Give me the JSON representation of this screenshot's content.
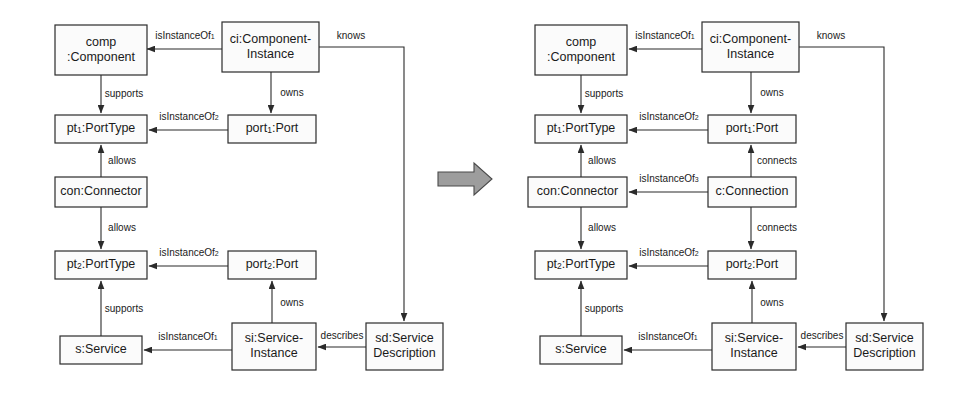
{
  "figure": {
    "background_color": "#ffffff",
    "box_fill": "#fbfbfb",
    "box_stroke": "#2b2b2b",
    "arrow_fill": "#9d9d9d",
    "arrow_stroke": "#4a4a4a"
  },
  "transform_arrow": {
    "name": "transformation-arrow",
    "direction": "right",
    "points": "438,172 474,172 474,163 492,179 474,195 474,186 438,186"
  },
  "diagrams": [
    {
      "id": "left",
      "name": "source-model-diagram",
      "nodes": [
        {
          "id": "comp",
          "name": "node-comp-component",
          "lines": [
            "comp",
            ":Component"
          ],
          "x": 55,
          "y": 25,
          "w": 92,
          "h": 50
        },
        {
          "id": "ci",
          "name": "node-ci-component-instance",
          "lines": [
            "ci:Component-",
            "Instance"
          ],
          "x": 222,
          "y": 22,
          "w": 97,
          "h": 50
        },
        {
          "id": "pt1",
          "name": "node-pt1-porttype",
          "lines": [
            "pt|1|:PortType"
          ],
          "x": 55,
          "y": 115,
          "w": 92,
          "h": 28
        },
        {
          "id": "port1",
          "name": "node-port1-port",
          "lines": [
            "port|1|:Port"
          ],
          "x": 228,
          "y": 115,
          "w": 88,
          "h": 28
        },
        {
          "id": "con",
          "name": "node-con-connector",
          "lines": [
            "con:Connector"
          ],
          "x": 55,
          "y": 177,
          "w": 92,
          "h": 30
        },
        {
          "id": "pt2",
          "name": "node-pt2-porttype",
          "lines": [
            "pt|2|:PortType"
          ],
          "x": 55,
          "y": 251,
          "w": 92,
          "h": 28
        },
        {
          "id": "port2",
          "name": "node-port2-port",
          "lines": [
            "port|2|:Port"
          ],
          "x": 228,
          "y": 251,
          "w": 88,
          "h": 28
        },
        {
          "id": "s",
          "name": "node-s-service",
          "lines": [
            "s:Service"
          ],
          "x": 60,
          "y": 336,
          "w": 82,
          "h": 28
        },
        {
          "id": "si",
          "name": "node-si-service-instance",
          "lines": [
            "si:Service-",
            "Instance"
          ],
          "x": 232,
          "y": 323,
          "w": 84,
          "h": 47
        },
        {
          "id": "sd",
          "name": "node-sd-service-description",
          "lines": [
            "sd:Service",
            "Description"
          ],
          "x": 366,
          "y": 323,
          "w": 77,
          "h": 47
        }
      ],
      "edges": [
        {
          "name": "edge-isinstanceof1-ci-comp",
          "label": "isInstanceOf|1|",
          "path": "222,49 147,49",
          "label_x": 185,
          "label_y": 36
        },
        {
          "name": "edge-knows-ci-sd",
          "label": "knows",
          "path": "319,47 404,47 404,321",
          "label_x": 351,
          "label_y": 36
        },
        {
          "name": "edge-supports-comp-pt1",
          "label": "supports",
          "path": "101,75 101,113",
          "label_x": 124,
          "label_y": 94
        },
        {
          "name": "edge-owns-ci-port1",
          "label": "owns",
          "path": "271,72 271,113",
          "label_x": 292,
          "label_y": 93
        },
        {
          "name": "edge-isinstanceof2-port1-pt1",
          "label": "isInstanceOf|2|",
          "path": "228,130 149,130",
          "label_x": 189,
          "label_y": 117
        },
        {
          "name": "edge-allows-con-pt1",
          "label": "allows",
          "path": "101,177 101,145",
          "label_x": 122,
          "label_y": 161
        },
        {
          "name": "edge-allows-con-pt2",
          "label": "allows",
          "path": "101,207 101,249",
          "label_x": 122,
          "label_y": 228
        },
        {
          "name": "edge-isinstanceof2-port2-pt2",
          "label": "isInstanceOf|2|",
          "path": "228,266 149,266",
          "label_x": 189,
          "label_y": 253
        },
        {
          "name": "edge-supports-s-pt2",
          "label": "supports",
          "path": "101,336 101,281",
          "label_x": 124,
          "label_y": 309
        },
        {
          "name": "edge-owns-si-port2",
          "label": "owns",
          "path": "272,323 272,281",
          "label_x": 292,
          "label_y": 303
        },
        {
          "name": "edge-isinstanceof1-si-s",
          "label": "isInstanceOf|1|",
          "path": "232,350 144,350",
          "label_x": 188,
          "label_y": 337
        },
        {
          "name": "edge-describes-sd-si",
          "label": "describes",
          "path": "366,347 318,347",
          "label_x": 342,
          "label_y": 336
        }
      ]
    },
    {
      "id": "right",
      "name": "target-model-diagram",
      "nodes": [
        {
          "id": "comp",
          "name": "node-comp-component",
          "lines": [
            "comp",
            ":Component"
          ],
          "x": 535,
          "y": 25,
          "w": 92,
          "h": 50
        },
        {
          "id": "ci",
          "name": "node-ci-component-instance",
          "lines": [
            "ci:Component-",
            "Instance"
          ],
          "x": 702,
          "y": 22,
          "w": 97,
          "h": 50
        },
        {
          "id": "pt1",
          "name": "node-pt1-porttype",
          "lines": [
            "pt|1|:PortType"
          ],
          "x": 535,
          "y": 115,
          "w": 92,
          "h": 28
        },
        {
          "id": "port1",
          "name": "node-port1-port",
          "lines": [
            "port|1|:Port"
          ],
          "x": 708,
          "y": 115,
          "w": 88,
          "h": 28
        },
        {
          "id": "con",
          "name": "node-con-connector",
          "lines": [
            "con:Connector"
          ],
          "x": 528,
          "y": 177,
          "w": 99,
          "h": 30
        },
        {
          "id": "conn",
          "name": "node-c-connection",
          "lines": [
            "c:Connection"
          ],
          "x": 708,
          "y": 177,
          "w": 88,
          "h": 30
        },
        {
          "id": "pt2",
          "name": "node-pt2-porttype",
          "lines": [
            "pt|2|:PortType"
          ],
          "x": 535,
          "y": 251,
          "w": 92,
          "h": 28
        },
        {
          "id": "port2",
          "name": "node-port2-port",
          "lines": [
            "port|2|:Port"
          ],
          "x": 708,
          "y": 251,
          "w": 88,
          "h": 28
        },
        {
          "id": "s",
          "name": "node-s-service",
          "lines": [
            "s:Service"
          ],
          "x": 540,
          "y": 336,
          "w": 82,
          "h": 28
        },
        {
          "id": "si",
          "name": "node-si-service-instance",
          "lines": [
            "si:Service-",
            "Instance"
          ],
          "x": 712,
          "y": 323,
          "w": 84,
          "h": 47
        },
        {
          "id": "sd",
          "name": "node-sd-service-description",
          "lines": [
            "sd:Service",
            "Description"
          ],
          "x": 846,
          "y": 323,
          "w": 77,
          "h": 47
        }
      ],
      "edges": [
        {
          "name": "edge-isinstanceof1-ci-comp",
          "label": "isInstanceOf|1|",
          "path": "702,49 629,49",
          "label_x": 665,
          "label_y": 36
        },
        {
          "name": "edge-knows-ci-sd",
          "label": "knows",
          "path": "799,47 884,47 884,321",
          "label_x": 831,
          "label_y": 36
        },
        {
          "name": "edge-supports-comp-pt1",
          "label": "supports",
          "path": "581,75 581,113",
          "label_x": 604,
          "label_y": 94
        },
        {
          "name": "edge-owns-ci-port1",
          "label": "owns",
          "path": "751,72 751,113",
          "label_x": 772,
          "label_y": 93
        },
        {
          "name": "edge-isinstanceof2-port1-pt1",
          "label": "isInstanceOf|2|",
          "path": "708,130 629,130",
          "label_x": 669,
          "label_y": 117
        },
        {
          "name": "edge-allows-con-pt1",
          "label": "allows",
          "path": "581,177 581,145",
          "label_x": 602,
          "label_y": 161
        },
        {
          "name": "edge-connects-conn-port1",
          "label": "connects",
          "path": "751,177 751,145",
          "label_x": 777,
          "label_y": 161
        },
        {
          "name": "edge-isinstanceof3-conn-con",
          "label": "isInstanceOf|3|",
          "path": "708,192 629,192",
          "label_x": 669,
          "label_y": 179
        },
        {
          "name": "edge-allows-con-pt2",
          "label": "allows",
          "path": "581,207 581,249",
          "label_x": 602,
          "label_y": 228
        },
        {
          "name": "edge-connects-conn-port2",
          "label": "connects",
          "path": "751,207 751,249",
          "label_x": 777,
          "label_y": 228
        },
        {
          "name": "edge-isinstanceof2-port2-pt2",
          "label": "isInstanceOf|2|",
          "path": "708,266 629,266",
          "label_x": 669,
          "label_y": 253
        },
        {
          "name": "edge-supports-s-pt2",
          "label": "supports",
          "path": "581,336 581,281",
          "label_x": 604,
          "label_y": 309
        },
        {
          "name": "edge-owns-si-port2",
          "label": "owns",
          "path": "752,323 752,281",
          "label_x": 772,
          "label_y": 303
        },
        {
          "name": "edge-isinstanceof1-si-s",
          "label": "isInstanceOf|1|",
          "path": "712,350 624,350",
          "label_x": 668,
          "label_y": 337
        },
        {
          "name": "edge-describes-sd-si",
          "label": "describes",
          "path": "846,347 798,347",
          "label_x": 822,
          "label_y": 336
        }
      ]
    }
  ]
}
